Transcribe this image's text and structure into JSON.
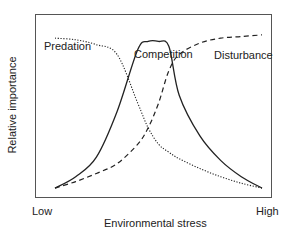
{
  "chart_data": {
    "type": "line",
    "title": "",
    "xlabel": "Environmental stress",
    "ylabel": "Relative importance",
    "x_tick_labels": [
      "Low",
      "High"
    ],
    "xlim": [
      0,
      1
    ],
    "ylim": [
      0,
      1
    ],
    "grid": false,
    "legend": "inline labels on curves",
    "x": [
      0.0,
      0.1,
      0.2,
      0.3,
      0.4,
      0.45,
      0.5,
      0.55,
      0.6,
      0.7,
      0.8,
      0.9,
      1.0
    ],
    "series": [
      {
        "name": "Predation",
        "style": "dotted",
        "values": [
          0.95,
          0.94,
          0.91,
          0.85,
          0.55,
          0.4,
          0.3,
          0.25,
          0.21,
          0.15,
          0.1,
          0.06,
          0.03
        ]
      },
      {
        "name": "Competition",
        "style": "solid",
        "values": [
          0.03,
          0.1,
          0.22,
          0.5,
          0.88,
          0.93,
          0.93,
          0.9,
          0.6,
          0.35,
          0.2,
          0.1,
          0.03
        ]
      },
      {
        "name": "Disturbance",
        "style": "dashed",
        "values": [
          0.03,
          0.07,
          0.12,
          0.18,
          0.3,
          0.4,
          0.55,
          0.75,
          0.85,
          0.92,
          0.95,
          0.96,
          0.97
        ]
      }
    ]
  },
  "labels": {
    "predation": "Predation",
    "competition": "Competition",
    "disturbance": "Disturbance",
    "x_low": "Low",
    "x_high": "High",
    "xlabel": "Environmental stress",
    "ylabel": "Relative importance"
  }
}
